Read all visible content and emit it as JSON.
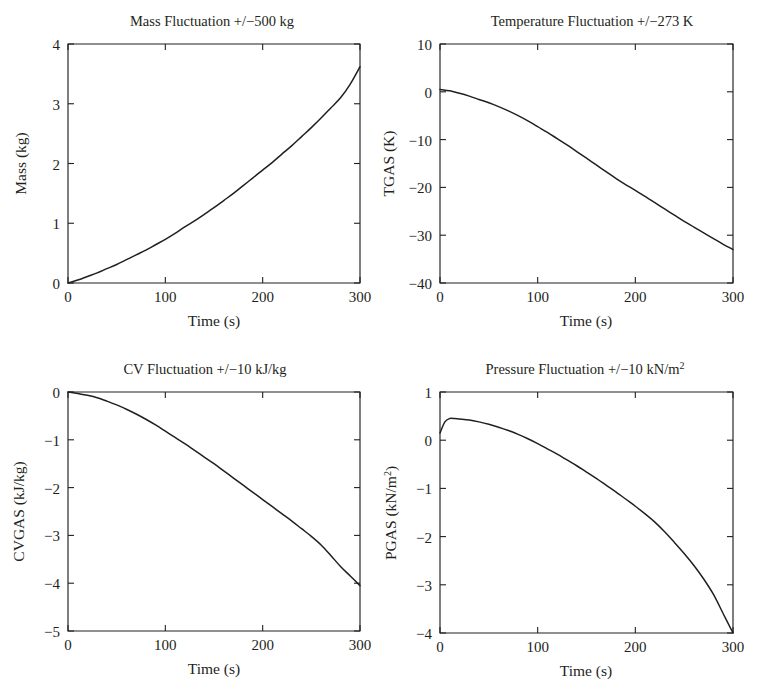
{
  "figure": {
    "background": "#ffffff",
    "line_color": "#231f20",
    "layout": "2x2 grid of line plots"
  },
  "panels": [
    {
      "id": "mass",
      "title": "Mass Fluctuation +/−500 kg",
      "xlabel": "Time (s)",
      "ylabel": "Mass (kg)",
      "xticks": [
        "0",
        "100",
        "200",
        "300"
      ],
      "yticks": [
        "0",
        "1",
        "2",
        "3",
        "4"
      ]
    },
    {
      "id": "temperature",
      "title": "Temperature Fluctuation +/−273 K",
      "xlabel": "Time (s)",
      "ylabel": "TGAS (K)",
      "xticks": [
        "0",
        "100",
        "200",
        "300"
      ],
      "yticks": [
        "−40",
        "−30",
        "−20",
        "−10",
        "0",
        "10"
      ]
    },
    {
      "id": "cv",
      "title": "CV Fluctuation +/−10 kJ/kg",
      "xlabel": "Time (s)",
      "ylabel": "CVGAS (kJ/kg)",
      "xticks": [
        "0",
        "100",
        "200",
        "300"
      ],
      "yticks": [
        "−5",
        "−4",
        "−3",
        "−2",
        "−1",
        "0"
      ]
    },
    {
      "id": "pressure",
      "title_main": "Pressure Fluctuation +/−10 kN/m",
      "title_sup": "2",
      "xlabel": "Time (s)",
      "ylabel_main": "PGAS (kN/m",
      "ylabel_sup": "2",
      "ylabel_tail": ")",
      "xticks": [
        "0",
        "100",
        "200",
        "300"
      ],
      "yticks": [
        "−4",
        "−3",
        "−2",
        "−1",
        "0",
        "1"
      ]
    }
  ],
  "chart_data": [
    {
      "type": "line",
      "id": "mass",
      "title": "Mass Fluctuation +/−500 kg",
      "xlabel": "Time (s)",
      "ylabel": "Mass (kg)",
      "xlim": [
        0,
        300
      ],
      "ylim": [
        0,
        4
      ],
      "grid": false,
      "legend": "none",
      "x": [
        0,
        10,
        20,
        30,
        40,
        50,
        60,
        70,
        80,
        90,
        100,
        110,
        120,
        130,
        140,
        150,
        160,
        170,
        180,
        190,
        200,
        210,
        220,
        230,
        240,
        250,
        260,
        270,
        280,
        290,
        300
      ],
      "y": [
        0.0,
        0.05,
        0.11,
        0.17,
        0.24,
        0.31,
        0.39,
        0.47,
        0.55,
        0.64,
        0.73,
        0.83,
        0.94,
        1.04,
        1.15,
        1.26,
        1.38,
        1.5,
        1.63,
        1.76,
        1.89,
        2.02,
        2.16,
        2.3,
        2.45,
        2.6,
        2.76,
        2.93,
        3.1,
        3.33,
        3.62
      ]
    },
    {
      "type": "line",
      "id": "temperature",
      "title": "Temperature Fluctuation +/−273 K",
      "xlabel": "Time (s)",
      "ylabel": "TGAS (K)",
      "xlim": [
        0,
        300
      ],
      "ylim": [
        -40,
        10
      ],
      "grid": false,
      "legend": "none",
      "x": [
        0,
        10,
        20,
        30,
        40,
        50,
        60,
        70,
        80,
        90,
        100,
        110,
        120,
        130,
        140,
        150,
        160,
        170,
        180,
        190,
        200,
        210,
        220,
        230,
        240,
        250,
        260,
        270,
        280,
        290,
        300
      ],
      "y": [
        0.5,
        0.2,
        -0.3,
        -0.9,
        -1.6,
        -2.3,
        -3.1,
        -4.0,
        -5.0,
        -6.1,
        -7.3,
        -8.5,
        -9.8,
        -11.1,
        -12.5,
        -13.9,
        -15.3,
        -16.7,
        -18.1,
        -19.4,
        -20.6,
        -21.9,
        -23.2,
        -24.5,
        -25.8,
        -27.1,
        -28.3,
        -29.5,
        -30.7,
        -31.9,
        -33.0
      ]
    },
    {
      "type": "line",
      "id": "cv",
      "title": "CV Fluctuation +/−10 kJ/kg",
      "xlabel": "Time (s)",
      "ylabel": "CVGAS (kJ/kg)",
      "xlim": [
        0,
        300
      ],
      "ylim": [
        -5,
        0
      ],
      "grid": false,
      "legend": "none",
      "x": [
        0,
        10,
        20,
        30,
        40,
        50,
        60,
        70,
        80,
        90,
        100,
        110,
        120,
        130,
        140,
        150,
        160,
        170,
        180,
        190,
        200,
        210,
        220,
        230,
        240,
        250,
        260,
        270,
        280,
        290,
        300
      ],
      "y": [
        0.0,
        -0.03,
        -0.07,
        -0.12,
        -0.19,
        -0.27,
        -0.36,
        -0.46,
        -0.57,
        -0.69,
        -0.82,
        -0.95,
        -1.08,
        -1.22,
        -1.36,
        -1.5,
        -1.65,
        -1.8,
        -1.95,
        -2.1,
        -2.25,
        -2.4,
        -2.55,
        -2.7,
        -2.86,
        -3.02,
        -3.2,
        -3.42,
        -3.65,
        -3.85,
        -4.05
      ]
    },
    {
      "type": "line",
      "id": "pressure",
      "title": "Pressure Fluctuation +/−10 kN/m2",
      "xlabel": "Time (s)",
      "ylabel": "PGAS (kN/m2)",
      "xlim": [
        0,
        300
      ],
      "ylim": [
        -4,
        1
      ],
      "grid": false,
      "legend": "none",
      "x": [
        0,
        5,
        10,
        15,
        20,
        30,
        40,
        50,
        60,
        70,
        80,
        90,
        100,
        110,
        120,
        130,
        140,
        150,
        160,
        170,
        180,
        190,
        200,
        210,
        220,
        230,
        240,
        250,
        260,
        270,
        280,
        290,
        300
      ],
      "y": [
        0.15,
        0.38,
        0.45,
        0.45,
        0.44,
        0.42,
        0.38,
        0.33,
        0.27,
        0.2,
        0.12,
        0.03,
        -0.07,
        -0.18,
        -0.29,
        -0.41,
        -0.53,
        -0.66,
        -0.79,
        -0.93,
        -1.07,
        -1.22,
        -1.37,
        -1.53,
        -1.7,
        -1.9,
        -2.12,
        -2.35,
        -2.6,
        -2.88,
        -3.2,
        -3.6,
        -4.0
      ]
    }
  ]
}
